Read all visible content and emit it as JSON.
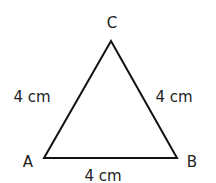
{
  "diagram": {
    "type": "equilateral-triangle",
    "vertices": [
      {
        "name": "A",
        "x": 44,
        "y": 158,
        "label_x": 28,
        "label_y": 167
      },
      {
        "name": "B",
        "x": 177,
        "y": 158,
        "label_x": 192,
        "label_y": 167
      },
      {
        "name": "C",
        "x": 111,
        "y": 41,
        "label_x": 112,
        "label_y": 28
      }
    ],
    "sides": [
      {
        "from": "A",
        "to": "C",
        "label": "4 cm",
        "label_x": 32,
        "label_y": 102
      },
      {
        "from": "C",
        "to": "B",
        "label": "4 cm",
        "label_x": 174,
        "label_y": 102
      },
      {
        "from": "A",
        "to": "B",
        "label": "4 cm",
        "label_x": 103,
        "label_y": 181
      }
    ],
    "stroke_color": "#111111",
    "text_color": "#222222"
  }
}
